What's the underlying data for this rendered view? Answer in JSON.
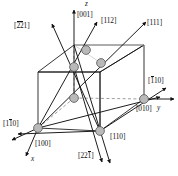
{
  "figure": {
    "type": "crystallographic-unit-cell-direction-diagram",
    "colors": {
      "line": "#111111",
      "atom_fill": "#b9b9b9",
      "atom_stroke": "#555555",
      "hidden_edge": "#8c8c8c",
      "background": "#ffffff"
    }
  },
  "axes": [
    {
      "key": "z",
      "symbol": "z",
      "index_label": "[001]"
    },
    {
      "key": "y",
      "symbol": "y",
      "index_label": "[010]"
    },
    {
      "key": "x",
      "symbol": "x",
      "index_label": "[100]"
    }
  ],
  "directions": [
    {
      "id": "d-22bar1bar",
      "digits": "221",
      "bars": [
        1,
        1,
        0
      ],
      "text": "[221]"
    },
    {
      "id": "d-001",
      "digits": "001",
      "bars": [
        0,
        0,
        0
      ],
      "text": "[001]"
    },
    {
      "id": "d-112",
      "digits": "112",
      "bars": [
        0,
        0,
        0
      ],
      "text": "[112]"
    },
    {
      "id": "d-111",
      "digits": "111",
      "bars": [
        0,
        0,
        0
      ],
      "text": "[111]"
    },
    {
      "id": "d-1bar10",
      "digits": "110",
      "bars": [
        1,
        0,
        0
      ],
      "text": "[110]"
    },
    {
      "id": "d-010",
      "digits": "010",
      "bars": [
        0,
        0,
        0
      ],
      "text": "[010]"
    },
    {
      "id": "d-11bar0",
      "digits": "110",
      "bars": [
        0,
        1,
        0
      ],
      "text": "[110]"
    },
    {
      "id": "d-100",
      "digits": "100",
      "bars": [
        0,
        0,
        0
      ],
      "text": "[100]"
    },
    {
      "id": "d-110",
      "digits": "110",
      "bars": [
        0,
        0,
        0
      ],
      "text": "[110]"
    },
    {
      "id": "d-221bar",
      "digits": "221",
      "bars": [
        0,
        0,
        1
      ],
      "text": "[221]"
    }
  ],
  "labels": {
    "bracket_open": "[",
    "bracket_close": "]",
    "top_left": {
      "d1": "2",
      "d2": "2",
      "d3": "1"
    },
    "z_axis": {
      "symbol": "z",
      "index": "[001]"
    },
    "top_mid": {
      "d1": "1",
      "d2": "1",
      "d3": "2"
    },
    "top_right": {
      "d1": "1",
      "d2": "1",
      "d3": "1"
    },
    "right_upper": {
      "d1": "1",
      "d2": "1",
      "d3": "0"
    },
    "right_y": {
      "index": "[010]",
      "symbol": "y"
    },
    "left_mid": {
      "d1": "1",
      "d2": "1",
      "d3": "0"
    },
    "left_x_index": {
      "index": "[100]",
      "symbol": "x"
    },
    "bottom_mid_right": {
      "d1": "1",
      "d2": "1",
      "d3": "0"
    },
    "bottom_mid": {
      "d1": "2",
      "d2": "2",
      "d3": "1"
    }
  },
  "atoms": [
    {
      "name": "atom-top-face-center",
      "cx": 86,
      "cy": 50,
      "r": 4.4
    },
    {
      "name": "atom-upper-left",
      "cx": 74,
      "cy": 67,
      "r": 4.4
    },
    {
      "name": "atom-upper-right",
      "cx": 101,
      "cy": 63,
      "r": 4.4
    },
    {
      "name": "atom-center-left",
      "cx": 74,
      "cy": 98,
      "r": 4.4
    },
    {
      "name": "atom-origin-front",
      "cx": 38,
      "cy": 128,
      "r": 4.4
    },
    {
      "name": "atom-front-right",
      "cx": 100,
      "cy": 131,
      "r": 4.4
    },
    {
      "name": "atom-right-corner",
      "cx": 144,
      "cy": 99,
      "r": 4.4
    }
  ]
}
